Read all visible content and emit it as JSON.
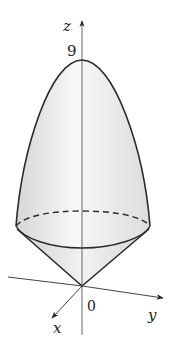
{
  "figure": {
    "labels": {
      "z_axis": "z",
      "y_axis": "y",
      "x_axis": "x",
      "origin": "0",
      "apex_value": "9"
    },
    "colors": {
      "outline": "#2a2a2a",
      "axis": "#444444",
      "fill_light": "#f7f7f7",
      "fill_dark": "#d9d9d9"
    }
  }
}
